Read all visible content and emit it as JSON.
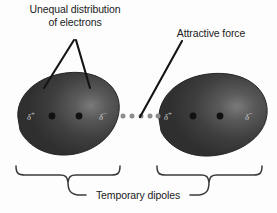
{
  "figure": {
    "background_color": "#fdfdfd"
  },
  "labels": {
    "unequal_distribution": "Unequal distribution\nof electrons",
    "attractive_force": "Attractive force",
    "temporary_dipoles": "Temporary dipoles"
  },
  "atoms": [
    {
      "name": "left-atom",
      "fill_color": "#3a3a3a",
      "highlight_color": "#6e6e6e",
      "charges": [
        {
          "symbol": "δ",
          "sign": "+",
          "position": "left"
        },
        {
          "symbol": "δ",
          "sign": "−",
          "position": "right"
        }
      ],
      "nuclei_dots": 2,
      "dot_color": "#111111"
    },
    {
      "name": "right-atom",
      "fill_color": "#3a3a3a",
      "highlight_color": "#6e6e6e",
      "charges": [
        {
          "symbol": "δ",
          "sign": "+",
          "position": "left"
        },
        {
          "symbol": "δ",
          "sign": "−",
          "position": "right"
        }
      ],
      "nuclei_dots": 2,
      "dot_color": "#111111"
    }
  ],
  "interaction": {
    "name": "dotted-attraction-line",
    "dot_count": 5,
    "dot_color": "#8c8c8c"
  },
  "charge_symbols": {
    "delta_positive": "δ",
    "delta_positive_sign": "+",
    "delta_negative": "δ",
    "delta_negative_sign": "−",
    "text_color": "#d5d5d5"
  },
  "annotations": {
    "leader_line_color": "#1b1b1b",
    "brace_color": "#3b3b3b"
  }
}
